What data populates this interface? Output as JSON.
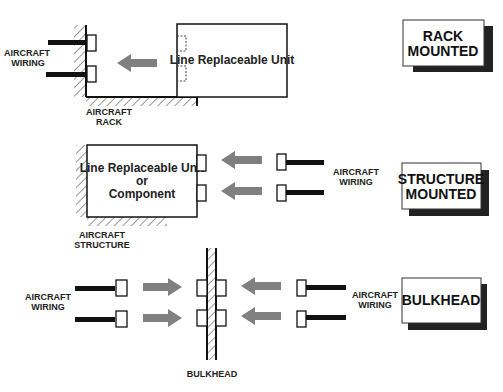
{
  "rack_section": {
    "wiring_label": [
      "AIRCRAFT",
      "WIRING"
    ],
    "rack_label": [
      "AIRCRAFT",
      "RACK"
    ],
    "unit_label": "Line Replaceable Unit",
    "badge": [
      "RACK",
      "MOUNTED"
    ]
  },
  "structure_section": {
    "unit_label": [
      "Line Replaceable Unit",
      "or",
      "Component"
    ],
    "structure_label": [
      "AIRCRAFT",
      "STRUCTURE"
    ],
    "wiring_label": [
      "AIRCRAFT",
      "WIRING"
    ],
    "badge": [
      "STRUCTURE",
      "MOUNTED"
    ]
  },
  "bulkhead_section": {
    "left_wiring_label": [
      "AIRCRAFT",
      "WIRING"
    ],
    "right_wiring_label": [
      "AIRCRAFT",
      "WIRING"
    ],
    "bulkhead_label": "BULKHEAD",
    "badge": "BULKHEAD"
  },
  "colors": {
    "arrow": "#808080",
    "line": "#111111",
    "shadow": "#222222"
  }
}
